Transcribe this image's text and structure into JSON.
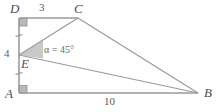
{
  "figure": {
    "colors": {
      "line": "#9a9a9a",
      "marker_fill": "#b3b3b3",
      "wedge_fill": "#c4c4c4",
      "label": "#4d4d4d",
      "background": "#ffffff"
    },
    "vertices": [
      {
        "name": "D",
        "label": "D",
        "x": 19,
        "y": 18
      },
      {
        "name": "C",
        "label": "C",
        "x": 78,
        "y": 18
      },
      {
        "name": "E",
        "label": "E",
        "x": 19,
        "y": 55
      },
      {
        "name": "A",
        "label": "A",
        "x": 19,
        "y": 93
      },
      {
        "name": "B",
        "label": "B",
        "x": 198,
        "y": 93
      }
    ],
    "segments": [
      {
        "name": "segment-DC",
        "from": "D",
        "to": "C"
      },
      {
        "name": "segment-DA",
        "from": "D",
        "to": "A"
      },
      {
        "name": "segment-AB",
        "from": "A",
        "to": "B"
      },
      {
        "name": "segment-CB",
        "from": "C",
        "to": "B"
      },
      {
        "name": "segment-EB",
        "from": "E",
        "to": "B"
      },
      {
        "name": "segment-EC",
        "from": "E",
        "to": "C"
      }
    ],
    "length_labels": [
      {
        "name": "length-DC",
        "text": "3",
        "segment": "DC"
      },
      {
        "name": "length-DE",
        "text": "4",
        "segment": "DE"
      },
      {
        "name": "length-AB",
        "text": "10",
        "segment": "AB"
      }
    ],
    "angle_labels": [
      {
        "name": "angle-alpha-at-E",
        "text": "α = 45°",
        "vertex": "E",
        "value": 45
      }
    ],
    "right_angles": [
      {
        "name": "right-angle-D",
        "vertex": "D"
      },
      {
        "name": "right-angle-A",
        "vertex": "A"
      }
    ],
    "tick_marks": [
      {
        "name": "tick-DE",
        "segment": "DE",
        "count": 1
      },
      {
        "name": "tick-EA",
        "segment": "EA",
        "count": 1
      }
    ]
  }
}
